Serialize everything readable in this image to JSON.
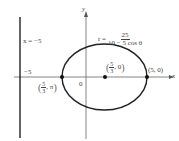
{
  "diagram": {
    "axes": {
      "x_label": "x",
      "y_label": "y",
      "origin_label": "0"
    },
    "directrix": {
      "label": "x = −5",
      "tick_label": "−5"
    },
    "equation": {
      "lhs": "r =",
      "numerator": "25",
      "denominator": "10 − 5 cos θ"
    },
    "points": [
      {
        "name": "focus",
        "num": "5",
        "den": "3",
        "rest": ", 0"
      },
      {
        "name": "right-vertex",
        "label": "(5, 0)"
      },
      {
        "name": "left-vertex",
        "num": "5",
        "den": "3",
        "rest": ", π"
      }
    ],
    "colors": {
      "curve": "#222222",
      "axis": "#555555"
    }
  }
}
